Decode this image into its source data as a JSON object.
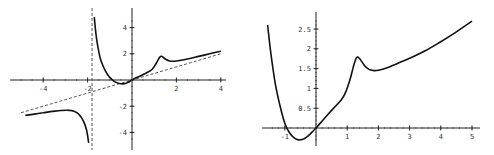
{
  "chart_data": [
    {
      "type": "line",
      "title": "",
      "xlabel": "",
      "ylabel": "",
      "xlim": [
        -5,
        4.2
      ],
      "ylim": [
        -4.8,
        4.8
      ],
      "xticks": [
        -4,
        -2,
        2,
        4
      ],
      "yticks": [
        4,
        2,
        -2,
        -4
      ],
      "xtick_labels": [
        "-4",
        "-2",
        "2",
        "4"
      ],
      "ytick_labels": [
        "4",
        "2",
        "-2",
        "-4"
      ],
      "grid": false,
      "vertical_asymptote": -1.8,
      "oblique_asymptote": {
        "slope": 0.5,
        "intercept": 0
      },
      "series": [
        {
          "name": "left-branch",
          "x": [
            -4.8,
            -4.4,
            -4.0,
            -3.6,
            -3.2,
            -2.8,
            -2.6,
            -2.4,
            -2.2,
            -2.05,
            -1.95
          ],
          "y": [
            -2.7,
            -2.6,
            -2.5,
            -2.4,
            -2.33,
            -2.32,
            -2.4,
            -2.6,
            -3.1,
            -3.8,
            -4.8
          ]
        },
        {
          "name": "right-branch",
          "x": [
            -1.7,
            -1.6,
            -1.5,
            -1.4,
            -1.2,
            -1.0,
            -0.8,
            -0.6,
            -0.4,
            -0.2,
            0,
            0.3,
            0.6,
            0.9,
            1.1,
            1.25,
            1.35,
            1.5,
            1.7,
            2.0,
            2.5,
            3.0,
            3.5,
            4.0
          ],
          "y": [
            4.8,
            3.2,
            2.2,
            1.5,
            0.7,
            0.2,
            -0.1,
            -0.25,
            -0.3,
            -0.2,
            0,
            0.25,
            0.5,
            0.8,
            1.3,
            1.75,
            1.8,
            1.6,
            1.45,
            1.45,
            1.6,
            1.8,
            2.0,
            2.2
          ]
        }
      ]
    },
    {
      "type": "line",
      "title": "",
      "xlabel": "",
      "ylabel": "",
      "xlim": [
        -1.5,
        5.2
      ],
      "ylim": [
        -0.35,
        2.8
      ],
      "xticks": [
        -1,
        1,
        2,
        3,
        4,
        5
      ],
      "yticks": [
        0.5,
        1,
        1.5,
        2,
        2.5
      ],
      "xtick_labels": [
        "-1",
        "1",
        "2",
        "3",
        "4",
        "5"
      ],
      "ytick_labels": [
        "0.5",
        "1",
        "1.5",
        "2",
        "2.5"
      ],
      "grid": false,
      "series": [
        {
          "name": "curve",
          "x": [
            -1.55,
            -1.45,
            -1.3,
            -1.15,
            -1.0,
            -0.85,
            -0.7,
            -0.55,
            -0.4,
            -0.25,
            -0.1,
            0,
            0.2,
            0.4,
            0.6,
            0.8,
            0.95,
            1.1,
            1.2,
            1.3,
            1.4,
            1.55,
            1.7,
            1.85,
            2.0,
            2.3,
            2.7,
            3.0,
            3.5,
            4.0,
            4.5,
            5.0
          ],
          "y": [
            2.6,
            1.9,
            1.1,
            0.55,
            0.12,
            -0.12,
            -0.25,
            -0.3,
            -0.28,
            -0.2,
            -0.08,
            0,
            0.18,
            0.36,
            0.53,
            0.7,
            0.9,
            1.25,
            1.55,
            1.78,
            1.75,
            1.58,
            1.48,
            1.45,
            1.46,
            1.53,
            1.66,
            1.76,
            1.95,
            2.18,
            2.43,
            2.7
          ]
        }
      ]
    }
  ]
}
